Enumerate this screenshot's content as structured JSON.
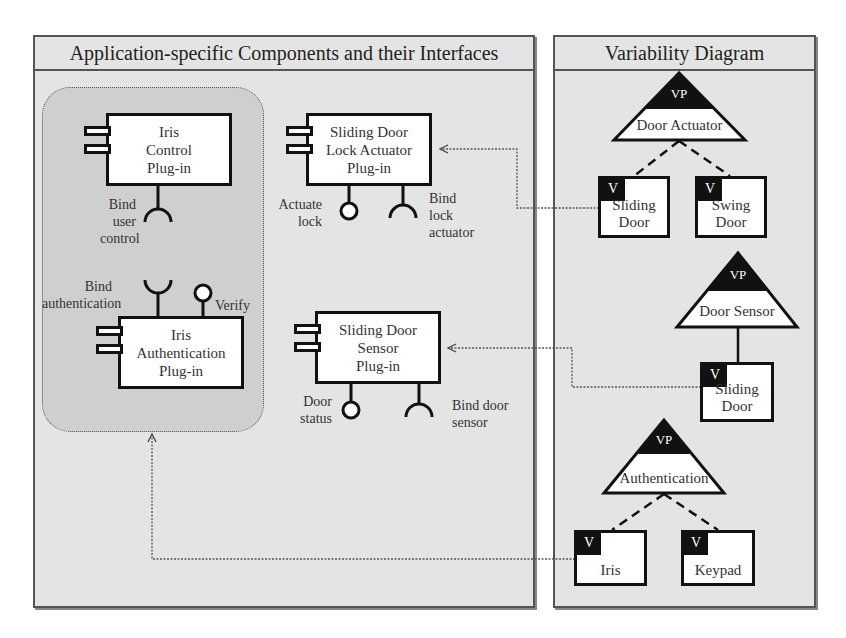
{
  "left_panel": {
    "title": "Application-specific Components and their Interfaces",
    "components": [
      {
        "id": "iris-control",
        "lines": [
          "Iris",
          "Control",
          "Plug-in"
        ],
        "interfaces": [
          {
            "type": "required",
            "label_lines": [
              "Bind",
              "user",
              "control"
            ]
          }
        ]
      },
      {
        "id": "iris-authentication",
        "lines": [
          "Iris",
          "Authentication",
          "Plug-in"
        ],
        "interfaces": [
          {
            "type": "required",
            "label_lines": [
              "Bind",
              "authentication"
            ]
          },
          {
            "type": "provided",
            "label_lines": [
              "Verify"
            ]
          }
        ]
      },
      {
        "id": "sliding-door-lock-actuator",
        "lines": [
          "Sliding Door",
          "Lock Actuator",
          "Plug-in"
        ],
        "interfaces": [
          {
            "type": "provided",
            "label_lines": [
              "Actuate",
              "lock"
            ]
          },
          {
            "type": "required",
            "label_lines": [
              "Bind",
              "lock",
              "actuator"
            ]
          }
        ]
      },
      {
        "id": "sliding-door-sensor",
        "lines": [
          "Sliding Door",
          "Sensor",
          "Plug-in"
        ],
        "interfaces": [
          {
            "type": "provided",
            "label_lines": [
              "Door",
              "status"
            ]
          },
          {
            "type": "required",
            "label_lines": [
              "Bind door",
              "sensor"
            ]
          }
        ]
      }
    ]
  },
  "right_panel": {
    "title": "Variability Diagram",
    "vp_tag": "VP",
    "v_tag": "V",
    "variation_points": [
      {
        "name": "Door Actuator",
        "variants": [
          [
            "Sliding",
            "Door"
          ],
          [
            "Swing",
            "Door"
          ]
        ],
        "relation": "dashed"
      },
      {
        "name": "Door Sensor",
        "variants": [
          [
            "Sliding",
            "Door"
          ]
        ],
        "relation": "solid"
      },
      {
        "name": "Authentication",
        "variants": [
          [
            "Iris"
          ],
          [
            "Keypad"
          ]
        ],
        "relation": "dashed"
      }
    ]
  },
  "mappings": [
    {
      "from": "Door Actuator / Sliding Door",
      "to": "Sliding Door Lock Actuator Plug-in"
    },
    {
      "from": "Door Sensor / Sliding Door",
      "to": "Sliding Door Sensor Plug-in"
    },
    {
      "from": "Authentication / Iris",
      "to": "Iris plug-in group"
    }
  ]
}
